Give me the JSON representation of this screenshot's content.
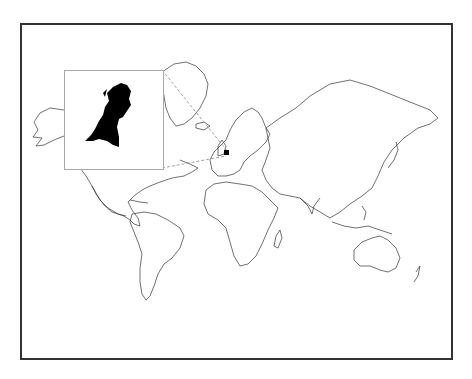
{
  "map": {
    "type": "world-outline-map",
    "projection": "mercator-like",
    "highlighted_region": "Netherlands",
    "inset": {
      "label": "Netherlands",
      "fill_color": "#000000",
      "border_color": "#aaaaaa"
    },
    "colors": {
      "background": "#ffffff",
      "coastline": "#333333",
      "frame": "#333333",
      "leader_line": "#888888"
    }
  }
}
